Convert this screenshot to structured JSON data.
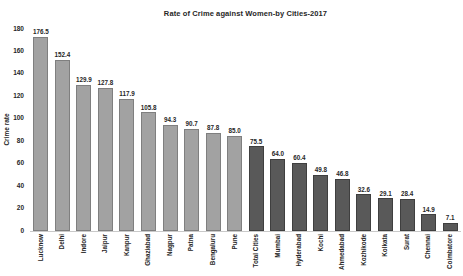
{
  "chart_data": {
    "type": "bar",
    "title": "Rate of Crime against Women-by Cities-2017",
    "xlabel": "",
    "ylabel": "Crime rate",
    "ylim": [
      0,
      180
    ],
    "yticks": [
      0,
      20,
      40,
      60,
      80,
      100,
      120,
      140,
      160,
      180
    ],
    "grid": false,
    "legend": "none",
    "categories": [
      "Lucknow",
      "Delhi",
      "Indore",
      "Jaipur",
      "Kanpur",
      "Ghaziabad",
      "Nagpur",
      "Patna",
      "Bengaluru",
      "Pune",
      "Total Cities",
      "Mumbai",
      "Hyderabad",
      "Kochi",
      "Ahmedabad",
      "Kozhikode",
      "Kolkata",
      "Surat",
      "Chennai",
      "Coimbatore"
    ],
    "values": [
      176.5,
      152.4,
      129.9,
      127.8,
      117.9,
      105.8,
      94.3,
      90.7,
      87.8,
      85.0,
      75.5,
      64.0,
      60.4,
      49.8,
      46.8,
      32.6,
      29.1,
      28.4,
      14.9,
      7.1
    ],
    "value_labels": [
      "176.5",
      "152.4",
      "129.9",
      "127.8",
      "117.9",
      "105.8",
      "94.3",
      "90.7",
      "87.8",
      "85.0",
      "75.5",
      "64.0",
      "60.4",
      "49.8",
      "46.8",
      "32.6",
      "29.1",
      "28.4",
      "14.9",
      "7.1"
    ],
    "colors": {
      "light_fill": "#a2a2a2",
      "light_border": "#7f7f7f",
      "dark_fill": "#595959",
      "dark_border": "#3f3f3f"
    },
    "dark_start_index": 10
  }
}
